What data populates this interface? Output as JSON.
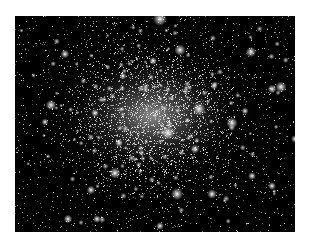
{
  "image": {
    "subject": "globular star cluster",
    "background": "#000000",
    "frame": "#ffffff",
    "core_center": [
      0.49,
      0.46
    ]
  },
  "bright_stars": [
    [
      145,
      3,
      3.2
    ],
    [
      165,
      34,
      2.6
    ],
    [
      236,
      36,
      2.4
    ],
    [
      50,
      38,
      2.0
    ],
    [
      138,
      45,
      1.8
    ],
    [
      266,
      71,
      2.6
    ],
    [
      257,
      73,
      2.0
    ],
    [
      36,
      89,
      2.4
    ],
    [
      184,
      93,
      3.0
    ],
    [
      80,
      97,
      1.8
    ],
    [
      217,
      107,
      2.6
    ],
    [
      153,
      117,
      3.0
    ],
    [
      104,
      127,
      1.8
    ],
    [
      280,
      123,
      1.8
    ],
    [
      100,
      157,
      2.6
    ],
    [
      180,
      133,
      2.0
    ],
    [
      162,
      178,
      2.8
    ],
    [
      197,
      178,
      2.2
    ],
    [
      76,
      174,
      2.0
    ],
    [
      237,
      160,
      1.8
    ],
    [
      53,
      203,
      2.0
    ],
    [
      82,
      203,
      1.8
    ],
    [
      145,
      210,
      1.8
    ],
    [
      208,
      230,
      2.2
    ],
    [
      257,
      170,
      1.8
    ],
    [
      30,
      106,
      1.6
    ],
    [
      199,
      70,
      1.6
    ],
    [
      108,
      60,
      1.6
    ],
    [
      230,
      95,
      1.6
    ]
  ]
}
